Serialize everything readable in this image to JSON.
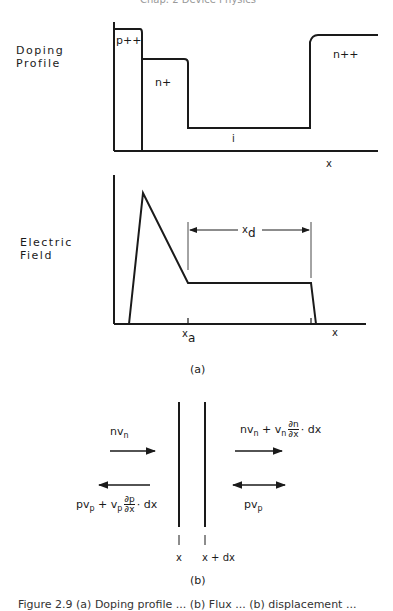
{
  "header_fragment": "Chap. 2  Device Physics",
  "panel_a": {
    "doping": {
      "ylabel_line1": "Doping",
      "ylabel_line2": "Profile",
      "regions": [
        "p++",
        "n+",
        "i",
        "n++"
      ],
      "xlabel": "x"
    },
    "field": {
      "ylabel_line1": "Electric",
      "ylabel_line2": "Field",
      "span_label": "x",
      "span_sub": "d",
      "tick_label": "x",
      "tick_sub": "a",
      "xlabel": "x"
    },
    "label": "(a)"
  },
  "panel_b": {
    "flux_n_left": "nv",
    "flux_n_left_sub": "n",
    "flux_n_right_pre": "nv",
    "flux_n_right_sub": "n",
    "flux_n_right_mid": " + v",
    "flux_n_right_sub2": "n",
    "flux_n_right_num": "∂n",
    "flux_n_right_den": "∂x",
    "flux_n_right_post": "· dx",
    "flux_p_left_pre": "pv",
    "flux_p_left_sub": "p",
    "flux_p_left_mid": " + v",
    "flux_p_left_sub2": "p",
    "flux_p_left_num": "∂p",
    "flux_p_left_den": "∂x",
    "flux_p_left_post": "· dx",
    "flux_p_right": "pv",
    "flux_p_right_sub": "p",
    "pos_left": "x",
    "pos_right": "x + dx",
    "label": "(b)"
  },
  "caption": "Figure 2.9 (a) Doping profile ... (b) Flux ... (b) displacement ..."
}
